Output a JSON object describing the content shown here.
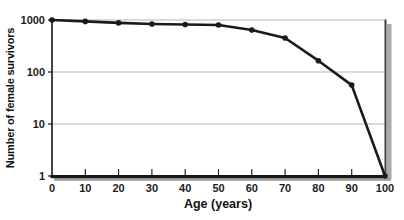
{
  "chart_data": {
    "type": "line",
    "title": "",
    "xlabel": "Age (years)",
    "ylabel": "Number of female survivors",
    "x": [
      0,
      10,
      20,
      30,
      40,
      50,
      60,
      70,
      80,
      90,
      100
    ],
    "series": [
      {
        "name": "Female survivors",
        "values": [
          1000,
          940,
          880,
          840,
          820,
          800,
          640,
          450,
          165,
          56,
          1
        ]
      }
    ],
    "x_ticks": [
      0,
      10,
      20,
      30,
      40,
      50,
      60,
      70,
      80,
      90,
      100
    ],
    "y_ticks": [
      1000,
      100,
      10,
      1
    ],
    "xlim": [
      0,
      100
    ],
    "ylim": [
      1,
      1000
    ],
    "yscale": "log",
    "grid": "horizontal-decades",
    "legend": "none",
    "marker": "filled-circle",
    "colors": {
      "line": "#1a1a1a",
      "marker": "#1a1a1a",
      "grid": "#b5b5b5",
      "axis": "#161616",
      "frame_right": "#3f3f3f",
      "shadow": "#9e9e9e",
      "background": "#ffffff",
      "text": "#1c1c1c"
    }
  }
}
